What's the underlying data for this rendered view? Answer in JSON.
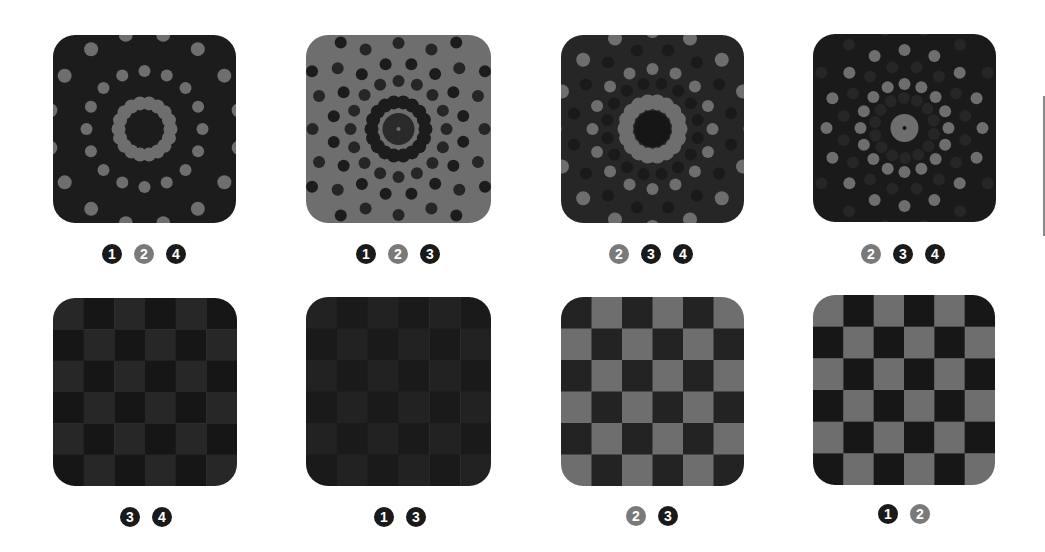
{
  "colors": {
    "dark": "#1c1c1c",
    "mid": "#6e6e6e",
    "darker": "#141414",
    "badge_dark": "#1a1a1a",
    "badge_gray": "#7a7a7a",
    "side_line": "#8a8a8a"
  },
  "tiles": [
    {
      "kind": "rings",
      "x": 53,
      "y": 35,
      "w": 183,
      "h": 188,
      "background": "#1c1c1c",
      "inner_ring": {
        "radius": 26,
        "count": 18,
        "dot_r": 7,
        "color": "#6e6e6e"
      },
      "outer_rings": [
        {
          "radius": 58,
          "count": 16,
          "dot_r": 6,
          "color": "#6e6e6e",
          "offset": 0.0
        },
        {
          "radius": 96,
          "count": 16,
          "dot_r": 7,
          "color": "#6e6e6e",
          "offset": 0.196
        }
      ],
      "center": null,
      "badges": [
        {
          "label": "1",
          "tone": "dark"
        },
        {
          "label": "2",
          "tone": "gray"
        },
        {
          "label": "4",
          "tone": "dark"
        }
      ],
      "badge_cx": 144,
      "badge_cy": 254
    },
    {
      "kind": "rings",
      "x": 306,
      "y": 35,
      "w": 185,
      "h": 188,
      "background": "#6e6e6e",
      "inner_ring": {
        "radius": 27,
        "count": 18,
        "dot_r": 7,
        "color": "#1c1c1c"
      },
      "outer_rings": [
        {
          "radius": 48,
          "count": 16,
          "dot_r": 6,
          "color": "#262626",
          "offset": 0.0
        },
        {
          "radius": 66,
          "count": 16,
          "dot_r": 6,
          "color": "#1c1c1c",
          "offset": 0.196
        },
        {
          "radius": 86,
          "count": 16,
          "dot_r": 6,
          "color": "#262626",
          "offset": 0.0
        },
        {
          "radius": 104,
          "count": 16,
          "dot_r": 6,
          "color": "#1c1c1c",
          "offset": 0.196
        }
      ],
      "center": {
        "r": 16,
        "color": "#2a2a2a",
        "dot_color": "#6e6e6e",
        "dot_r": 2
      },
      "badges": [
        {
          "label": "1",
          "tone": "dark"
        },
        {
          "label": "2",
          "tone": "gray"
        },
        {
          "label": "3",
          "tone": "dark"
        }
      ],
      "badge_cx": 398,
      "badge_cy": 254
    },
    {
      "kind": "rings",
      "x": 561,
      "y": 35,
      "w": 183,
      "h": 188,
      "background": "#262626",
      "inner_ring": {
        "radius": 27,
        "count": 18,
        "dot_r": 8,
        "color": "#6e6e6e"
      },
      "outer_rings": [
        {
          "radius": 46,
          "count": 16,
          "dot_r": 6,
          "color": "#1a1a1a",
          "offset": 0.196
        },
        {
          "radius": 60,
          "count": 16,
          "dot_r": 6,
          "color": "#6e6e6e",
          "offset": 0.0
        },
        {
          "radius": 80,
          "count": 16,
          "dot_r": 6,
          "color": "#1a1a1a",
          "offset": 0.196
        },
        {
          "radius": 98,
          "count": 16,
          "dot_r": 7,
          "color": "#6e6e6e",
          "offset": 0.0
        }
      ],
      "center": {
        "r": 18,
        "color": "#161616",
        "dot_color": null,
        "dot_r": 0
      },
      "badges": [
        {
          "label": "2",
          "tone": "gray"
        },
        {
          "label": "3",
          "tone": "dark"
        },
        {
          "label": "4",
          "tone": "dark"
        }
      ],
      "badge_cx": 651,
      "badge_cy": 254
    },
    {
      "kind": "rings",
      "x": 813,
      "y": 34,
      "w": 183,
      "h": 188,
      "background": "#1a1a1a",
      "inner_ring": {
        "radius": 44,
        "count": 16,
        "dot_r": 6,
        "color": "#6e6e6e"
      },
      "outer_rings": [
        {
          "radius": 30,
          "count": 14,
          "dot_r": 6,
          "color": "#262626",
          "offset": 0.2
        },
        {
          "radius": 62,
          "count": 16,
          "dot_r": 6,
          "color": "#262626",
          "offset": 0.196
        },
        {
          "radius": 78,
          "count": 16,
          "dot_r": 6,
          "color": "#6e6e6e",
          "offset": 0.0
        },
        {
          "radius": 100,
          "count": 16,
          "dot_r": 6,
          "color": "#262626",
          "offset": 0.196
        }
      ],
      "center": {
        "r": 14,
        "color": "#6e6e6e",
        "dot_color": "#141414",
        "dot_r": 2
      },
      "badges": [
        {
          "label": "2",
          "tone": "gray"
        },
        {
          "label": "3",
          "tone": "dark"
        },
        {
          "label": "4",
          "tone": "dark"
        }
      ],
      "badge_cx": 903,
      "badge_cy": 254
    },
    {
      "kind": "checker",
      "x": 53,
      "y": 298,
      "w": 184,
      "h": 188,
      "cols": 6,
      "rows": 6,
      "color_a": "#272727",
      "color_b": "#161616",
      "badges": [
        {
          "label": "3",
          "tone": "dark"
        },
        {
          "label": "4",
          "tone": "dark"
        }
      ],
      "badge_cx": 146,
      "badge_cy": 517
    },
    {
      "kind": "checker",
      "x": 306,
      "y": 297,
      "w": 185,
      "h": 189,
      "cols": 6,
      "rows": 6,
      "color_a": "#222222",
      "color_b": "#1a1a1a",
      "badges": [
        {
          "label": "1",
          "tone": "dark"
        },
        {
          "label": "3",
          "tone": "dark"
        }
      ],
      "badge_cx": 400,
      "badge_cy": 517
    },
    {
      "kind": "checker",
      "x": 561,
      "y": 297,
      "w": 183,
      "h": 189,
      "cols": 6,
      "rows": 6,
      "color_a": "#232323",
      "color_b": "#6e6e6e",
      "badges": [
        {
          "label": "2",
          "tone": "gray"
        },
        {
          "label": "3",
          "tone": "dark"
        }
      ],
      "badge_cx": 652,
      "badge_cy": 516
    },
    {
      "kind": "checker",
      "x": 813,
      "y": 295,
      "w": 182,
      "h": 190,
      "cols": 6,
      "rows": 6,
      "color_a": "#6e6e6e",
      "color_b": "#171717",
      "badges": [
        {
          "label": "1",
          "tone": "dark"
        },
        {
          "label": "2",
          "tone": "gray"
        }
      ],
      "badge_cx": 904,
      "badge_cy": 514
    }
  ]
}
